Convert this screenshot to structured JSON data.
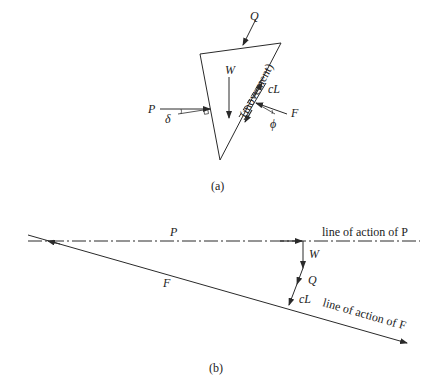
{
  "figure_a": {
    "caption": "(a)",
    "labels": {
      "Q": "Q",
      "W": "W",
      "movement": "(movement)",
      "cL": "cL",
      "P": "P",
      "delta": "δ",
      "F": "F",
      "phi": "ϕ"
    }
  },
  "figure_b": {
    "caption": "(b)",
    "labels": {
      "P": "P",
      "line_p": "line of action of P",
      "W": "W",
      "Q": "Q",
      "cL": "cL",
      "F": "F",
      "line_f": "line of action of F"
    }
  },
  "colors": {
    "line": "#2a2a2a",
    "background": "#ffffff"
  }
}
